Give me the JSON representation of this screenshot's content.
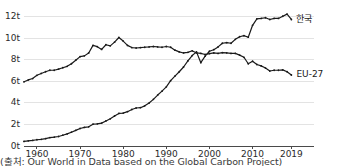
{
  "caption": "(출처: Our World in Data based on the Global Carbon Project)",
  "labels": {
    "series_korea": "한국",
    "series_eu27": "EU-27"
  },
  "chart_data": {
    "type": "line",
    "title": "",
    "subtitle": "",
    "xlabel": "",
    "ylabel": "",
    "unit": "t",
    "grid": true,
    "legend_position": "inline-right",
    "xlim": [
      1957,
      2021
    ],
    "ylim": [
      0,
      12.6
    ],
    "ytick_values": [
      0,
      2,
      4,
      6,
      8,
      10,
      12
    ],
    "ytick_labels": [
      "0t",
      "2t",
      "4t",
      "6t",
      "8t",
      "10t",
      "12t"
    ],
    "xtick_values": [
      1960,
      1970,
      1980,
      1990,
      2000,
      2010,
      2019
    ],
    "xtick_labels": [
      "1960",
      "1970",
      "1980",
      "1990",
      "2000",
      "2010",
      "2019"
    ],
    "x": [
      1957,
      1958,
      1959,
      1960,
      1961,
      1962,
      1963,
      1964,
      1965,
      1966,
      1967,
      1968,
      1969,
      1970,
      1971,
      1972,
      1973,
      1974,
      1975,
      1976,
      1977,
      1978,
      1979,
      1980,
      1981,
      1982,
      1983,
      1984,
      1985,
      1986,
      1987,
      1988,
      1989,
      1990,
      1991,
      1992,
      1993,
      1994,
      1995,
      1996,
      1997,
      1998,
      1999,
      2000,
      2001,
      2002,
      2003,
      2004,
      2005,
      2006,
      2007,
      2008,
      2009,
      2010,
      2011,
      2012,
      2013,
      2014,
      2015,
      2016,
      2017,
      2018,
      2019
    ],
    "series": [
      {
        "name": "EU-27",
        "label": "EU-27",
        "color": "#1a1a1a",
        "values": [
          5.95,
          6.12,
          6.25,
          6.55,
          6.72,
          6.88,
          7.02,
          7.02,
          7.12,
          7.25,
          7.38,
          7.62,
          7.95,
          8.28,
          8.35,
          8.62,
          9.32,
          9.2,
          8.95,
          9.38,
          9.28,
          9.62,
          10.05,
          9.72,
          9.32,
          9.12,
          9.08,
          9.12,
          9.15,
          9.18,
          9.22,
          9.18,
          9.15,
          9.22,
          9.15,
          8.88,
          8.72,
          8.62,
          8.68,
          8.82,
          8.62,
          8.58,
          8.48,
          8.55,
          8.62,
          8.58,
          8.65,
          8.62,
          8.58,
          8.58,
          8.42,
          8.22,
          7.62,
          7.85,
          7.55,
          7.42,
          7.22,
          6.95,
          7.02,
          7.02,
          7.05,
          6.88,
          6.58
        ]
      },
      {
        "name": "한국",
        "label": "한국",
        "color": "#1a1a1a",
        "values": [
          0.42,
          0.48,
          0.52,
          0.58,
          0.62,
          0.68,
          0.78,
          0.82,
          0.88,
          1.0,
          1.12,
          1.28,
          1.45,
          1.62,
          1.72,
          1.78,
          2.02,
          2.05,
          2.12,
          2.32,
          2.52,
          2.78,
          3.02,
          3.05,
          3.18,
          3.38,
          3.52,
          3.55,
          3.72,
          3.98,
          4.32,
          4.72,
          5.08,
          5.48,
          6.05,
          6.48,
          6.88,
          7.32,
          7.88,
          8.38,
          8.72,
          7.72,
          8.32,
          8.78,
          8.92,
          9.18,
          9.52,
          9.58,
          9.52,
          9.88,
          10.12,
          10.22,
          10.08,
          11.18,
          11.78,
          11.82,
          11.88,
          11.72,
          11.82,
          11.82,
          12.02,
          12.22,
          11.72
        ]
      }
    ],
    "annotations": [
      {
        "text": "한국",
        "x": 2019,
        "y": 11.72,
        "position": "right"
      },
      {
        "text": "EU-27",
        "x": 2019,
        "y": 6.58,
        "position": "right"
      }
    ]
  }
}
